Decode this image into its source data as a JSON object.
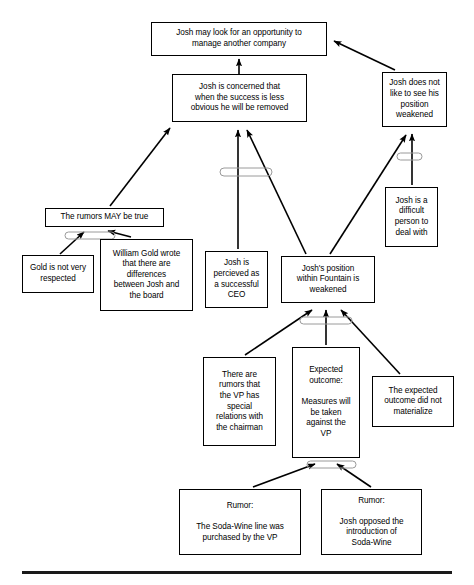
{
  "diagram": {
    "type": "causal-tree",
    "nodes": [
      {
        "id": "n1",
        "text": "Josh may look for an opportunity to\nmanage another company",
        "x": 151,
        "y": 22,
        "w": 176,
        "h": 34
      },
      {
        "id": "n2",
        "text": "Josh is concerned that\nwhen the success is less\nobvious he will be removed",
        "x": 172,
        "y": 74,
        "w": 135,
        "h": 48
      },
      {
        "id": "n3",
        "text": "Josh does not\nlike to see his\nposition\nweakened",
        "x": 382,
        "y": 72,
        "w": 65,
        "h": 55
      },
      {
        "id": "n4",
        "text": "Josh is a\ndifficult\nperson to\ndeal with",
        "x": 385,
        "y": 187,
        "w": 53,
        "h": 60
      },
      {
        "id": "n5",
        "text": "The rumors MAY be true",
        "x": 45,
        "y": 208,
        "w": 119,
        "h": 19
      },
      {
        "id": "n6",
        "text": "Gold is not very\nrespected",
        "x": 22,
        "y": 255,
        "w": 72,
        "h": 38
      },
      {
        "id": "n7",
        "text": "William Gold wrote\nthat there are\ndifferences\nbetween Josh and\nthe board",
        "x": 100,
        "y": 239,
        "w": 93,
        "h": 72
      },
      {
        "id": "n8",
        "text": "Josh is\npercieved as\na successful\nCEO",
        "x": 205,
        "y": 251,
        "w": 63,
        "h": 57
      },
      {
        "id": "n9",
        "text": "Josh's position\nwithin Fountain is\nweakened",
        "x": 281,
        "y": 256,
        "w": 94,
        "h": 47
      },
      {
        "id": "n10",
        "text": "There are\nrumors that\nthe VP has\nspecial\nrelations with\nthe chairman",
        "x": 203,
        "y": 357,
        "w": 73,
        "h": 89
      },
      {
        "id": "n11",
        "text": "Expected\noutcome:\n\nMeasures will\nbe taken\nagainst the\nVP",
        "x": 292,
        "y": 347,
        "w": 68,
        "h": 111
      },
      {
        "id": "n12",
        "text": "The expected\noutcome did not\nmaterialize",
        "x": 372,
        "y": 376,
        "w": 82,
        "h": 51
      },
      {
        "id": "n13",
        "text": "Rumor:\n\nThe Soda-Wine line was\npurchased by the VP",
        "x": 179,
        "y": 489,
        "w": 122,
        "h": 66
      },
      {
        "id": "n14",
        "text": "Rumor:\n\nJosh opposed the\nintroduction of\nSoda-Wine",
        "x": 321,
        "y": 489,
        "w": 101,
        "h": 66
      }
    ],
    "edges": [
      {
        "from": "n2",
        "to": "n1",
        "label": "concern-causes-looking"
      },
      {
        "from": "n3",
        "to": "n1",
        "label": "dislike-causes-looking"
      },
      {
        "from": "n5",
        "to": "n2",
        "label": "rumors-cause-concern"
      },
      {
        "from": "n8",
        "to": "n2",
        "label": "perception-causes-concern"
      },
      {
        "from": "n9",
        "to": "n2",
        "label": "weak-position-causes-concern"
      },
      {
        "from": "n9",
        "to": "n3",
        "label": "weak-position-causes-dislike"
      },
      {
        "from": "n4",
        "to": "n3",
        "label": "difficult-person-causes-dislike"
      },
      {
        "from": "n6",
        "to": "n5",
        "label": "gold-not-respected"
      },
      {
        "from": "n7",
        "to": "n5",
        "label": "gold-wrote-differences"
      },
      {
        "from": "n10",
        "to": "n9",
        "label": "vp-rumors-weaken"
      },
      {
        "from": "n11",
        "to": "n9",
        "label": "expected-measures-weaken"
      },
      {
        "from": "n12",
        "to": "n9",
        "label": "outcome-not-materialized-weakens"
      },
      {
        "from": "n13",
        "to": "n11",
        "label": "soda-wine-purchase-rumor"
      },
      {
        "from": "n14",
        "to": "n11",
        "label": "josh-opposed-rumor"
      }
    ],
    "conjunctions": [
      {
        "id": "c1",
        "label": "and-connector-concern",
        "x": 220,
        "y": 168,
        "w": 52,
        "h": 8
      },
      {
        "id": "c2",
        "label": "and-connector-rumors",
        "x": 65,
        "y": 232,
        "w": 50,
        "h": 7
      },
      {
        "id": "c3",
        "label": "and-connector-dislike",
        "x": 397,
        "y": 153,
        "w": 25,
        "h": 7
      },
      {
        "id": "c4",
        "label": "and-connector-position",
        "x": 300,
        "y": 317,
        "w": 52,
        "h": 7
      },
      {
        "id": "c5",
        "label": "and-connector-measures",
        "x": 307,
        "y": 461,
        "w": 49,
        "h": 7
      }
    ],
    "rule": {
      "label": "bottom-divider"
    }
  }
}
